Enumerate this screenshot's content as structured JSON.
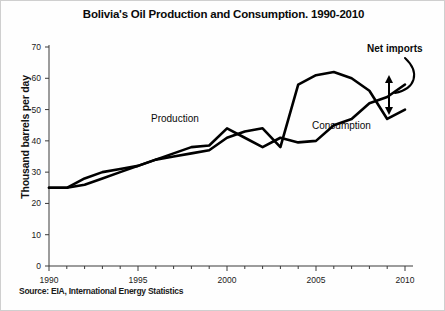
{
  "chart_data": {
    "type": "line",
    "title": "Bolivia's Oil Production and Consumption. 1990-2010",
    "xlabel": "",
    "ylabel": "Thousand barrels per day",
    "xlim": [
      1990,
      2010
    ],
    "ylim": [
      0,
      70
    ],
    "ytick_step": 10,
    "xtick_step": 5,
    "xminor_step": 1,
    "grid": false,
    "legend_position": "inline-annotations",
    "yticks": [
      "0",
      "10",
      "20",
      "30",
      "40",
      "50",
      "60",
      "70"
    ],
    "xticks": [
      "1990",
      "1995",
      "2000",
      "2005",
      "2010"
    ],
    "x": [
      1990,
      1991,
      1992,
      1993,
      1994,
      1995,
      1996,
      1997,
      1998,
      1999,
      2000,
      2001,
      2002,
      2003,
      2004,
      2005,
      2006,
      2007,
      2008,
      2009,
      2010
    ],
    "series": [
      {
        "name": "Production",
        "label": "Production",
        "color": "#000000",
        "values": [
          25,
          25,
          28,
          30,
          31,
          32,
          34,
          36,
          38,
          38.5,
          44,
          41,
          38,
          41,
          39.5,
          40,
          45,
          47,
          52,
          54,
          58
        ]
      },
      {
        "name": "Consumption",
        "label": "Consumption",
        "color": "#000000",
        "values": [
          25,
          25,
          26,
          28,
          30,
          32,
          34,
          35,
          36,
          37,
          41,
          43,
          44,
          38,
          58,
          61,
          62,
          60,
          56,
          47,
          50
        ]
      }
    ],
    "annotations": [
      {
        "name": "net-imports",
        "text": "Net imports",
        "description": "double-headed vertical arrow spanning the gap between the two series near 2008-2009"
      }
    ],
    "source_note": "Source: EIA, International Energy Statistics"
  },
  "colors": {
    "line": "#000000",
    "axis": "#3a3a3a",
    "text": "#0a0a0a",
    "background": "#fefefe"
  }
}
